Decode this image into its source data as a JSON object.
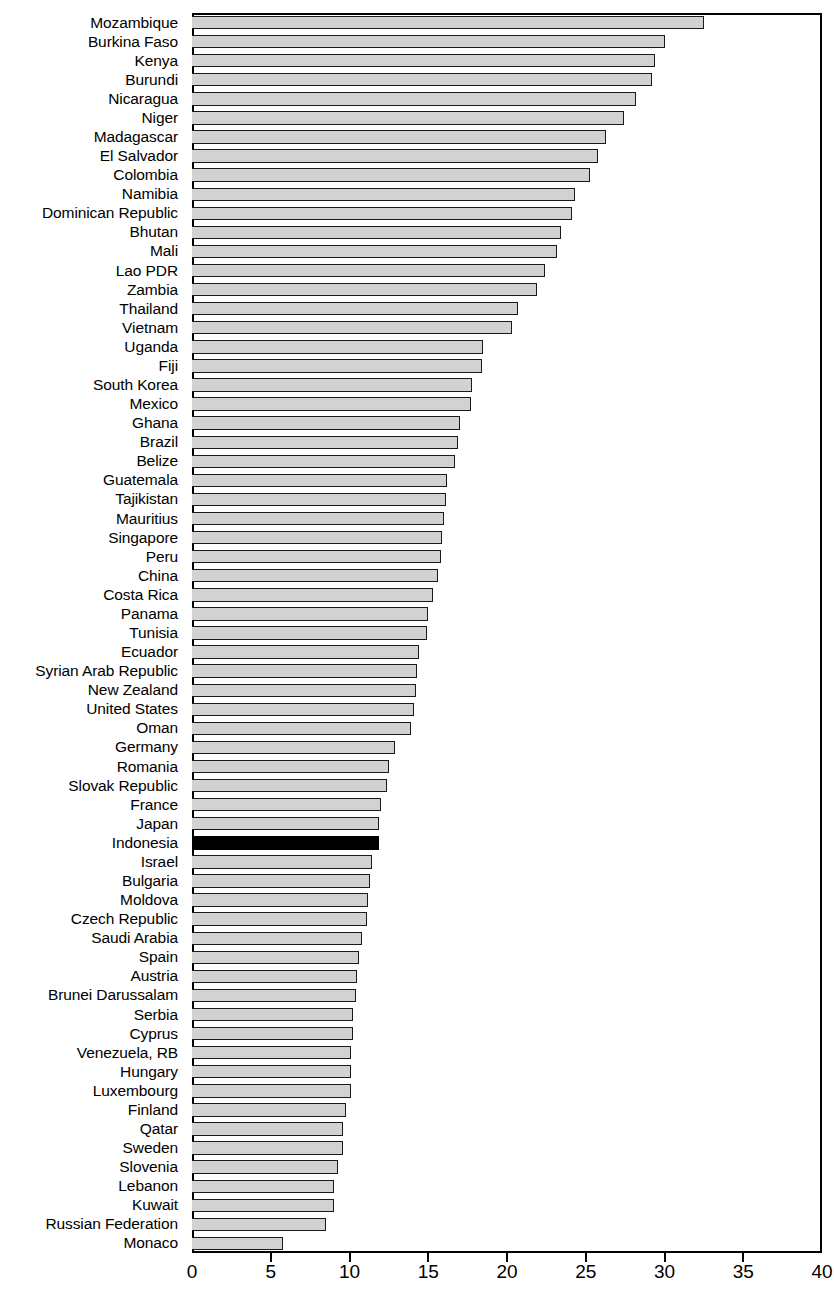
{
  "chart_data": {
    "type": "bar",
    "orientation": "horizontal",
    "title": "",
    "subtitle": "",
    "xlabel": "",
    "ylabel": "",
    "xlim": [
      0,
      40
    ],
    "ylim": null,
    "grid": false,
    "legend": null,
    "xticks": [
      0,
      5,
      10,
      15,
      20,
      25,
      30,
      35,
      40
    ],
    "xtick_labels": [
      "0",
      "5",
      "10",
      "15",
      "20",
      "25",
      "30",
      "35",
      "40"
    ],
    "bar_fill_color": "#d2d2d2",
    "bar_edge_color": "#1a1a1a",
    "highlight_color": "#000000",
    "highlighted_categories": [
      "Indonesia"
    ],
    "categories": [
      "Mozambique",
      "Burkina Faso",
      "Kenya",
      "Burundi",
      "Nicaragua",
      "Niger",
      "Madagascar",
      "El Salvador",
      "Colombia",
      "Namibia",
      "Dominican Republic",
      "Bhutan",
      "Mali",
      "Lao PDR",
      "Zambia",
      "Thailand",
      "Vietnam",
      "Uganda",
      "Fiji",
      "South Korea",
      "Mexico",
      "Ghana",
      "Brazil",
      "Belize",
      "Guatemala",
      "Tajikistan",
      "Mauritius",
      "Singapore",
      "Peru",
      "China",
      "Costa Rica",
      "Panama",
      "Tunisia",
      "Ecuador",
      "Syrian Arab Republic",
      "New Zealand",
      "United States",
      "Oman",
      "Germany",
      "Romania",
      "Slovak Republic",
      "France",
      "Japan",
      "Indonesia",
      "Israel",
      "Bulgaria",
      "Moldova",
      "Czech Republic",
      "Saudi Arabia",
      "Spain",
      "Austria",
      "Brunei Darussalam",
      "Serbia",
      "Cyprus",
      "Venezuela, RB",
      "Hungary",
      "Luxembourg",
      "Finland",
      "Qatar",
      "Sweden",
      "Slovenia",
      "Lebanon",
      "Kuwait",
      "Russian Federation",
      "Monaco"
    ],
    "values": [
      32.5,
      30.0,
      29.4,
      29.2,
      28.2,
      27.4,
      26.3,
      25.8,
      25.3,
      24.3,
      24.1,
      23.4,
      23.2,
      22.4,
      21.9,
      20.7,
      20.3,
      18.5,
      18.4,
      17.8,
      17.7,
      17.0,
      16.9,
      16.7,
      16.2,
      16.1,
      16.0,
      15.9,
      15.8,
      15.6,
      15.3,
      15.0,
      14.9,
      14.4,
      14.3,
      14.2,
      14.1,
      13.9,
      12.9,
      12.5,
      12.4,
      12.0,
      11.9,
      11.9,
      11.4,
      11.3,
      11.2,
      11.1,
      10.8,
      10.6,
      10.5,
      10.4,
      10.2,
      10.2,
      10.1,
      10.1,
      10.1,
      9.8,
      9.6,
      9.6,
      9.3,
      9.0,
      9.0,
      8.5,
      5.8
    ]
  }
}
